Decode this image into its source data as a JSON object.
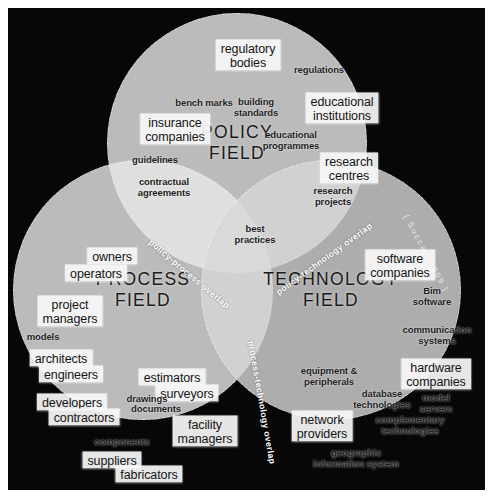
{
  "figure": {
    "citation": "( Succar, 2009 )",
    "background_color": "#070707",
    "frame_color": "#ffffff"
  },
  "fields": [
    {
      "id": "policy",
      "title": "POLICY\nFIELD",
      "color": "#e8e8e8",
      "center": {
        "x": 229,
        "y": 135
      }
    },
    {
      "id": "process",
      "title": "PROCESS\nFIELD",
      "color": "#e8e8e8",
      "center": {
        "x": 135,
        "y": 282
      }
    },
    {
      "id": "technology",
      "title": "TECHNOLOGY\nFIELD",
      "color": "#d7d7d7",
      "center": {
        "x": 323,
        "y": 282
      }
    }
  ],
  "overlaps": [
    {
      "id": "policy-process",
      "label": "policy-process overlap",
      "color": "#9a9a9a"
    },
    {
      "id": "policy-technology",
      "label": "policy-technology overlap",
      "color": "#9a9a9a"
    },
    {
      "id": "process-technology",
      "label": "process-technology overlap",
      "color": "#8e8e8e"
    }
  ],
  "keywords": {
    "policy": [
      {
        "text": "regulatory\nbodies",
        "style": "boxed",
        "x": 240,
        "y": 47
      },
      {
        "text": "regulations",
        "style": "plain",
        "x": 311,
        "y": 62
      },
      {
        "text": "bench marks",
        "style": "plain",
        "x": 196,
        "y": 95
      },
      {
        "text": "building\nstandards",
        "style": "plain",
        "x": 248,
        "y": 100
      },
      {
        "text": "educational\ninstitutions",
        "style": "boxed",
        "x": 334,
        "y": 100
      },
      {
        "text": "insurance\ncompanies",
        "style": "boxed",
        "x": 167,
        "y": 121
      },
      {
        "text": "educational\nprogrammes",
        "style": "plain",
        "x": 283,
        "y": 133
      },
      {
        "text": "guidelines",
        "style": "plain",
        "x": 147,
        "y": 152
      },
      {
        "text": "research\ncentres",
        "style": "boxed",
        "x": 341,
        "y": 160
      },
      {
        "text": "contractual\nagreements",
        "style": "plain",
        "x": 156,
        "y": 180
      },
      {
        "text": "research\nprojects",
        "style": "plain",
        "x": 325,
        "y": 189
      },
      {
        "text": "best\npractices",
        "style": "plain",
        "x": 247,
        "y": 227
      }
    ],
    "process": [
      {
        "text": "owners",
        "style": "boxed",
        "x": 104,
        "y": 248
      },
      {
        "text": "operators",
        "style": "boxed",
        "x": 88,
        "y": 265
      },
      {
        "text": "project\nmanagers",
        "style": "boxed",
        "x": 62,
        "y": 303
      },
      {
        "text": "models",
        "style": "plain",
        "x": 35,
        "y": 329
      },
      {
        "text": "architects",
        "style": "boxed",
        "x": 53,
        "y": 350
      },
      {
        "text": "engineers",
        "style": "boxed",
        "x": 63,
        "y": 366
      },
      {
        "text": "estimators",
        "style": "boxed",
        "x": 164,
        "y": 369
      },
      {
        "text": "surveyors",
        "style": "boxed",
        "x": 179,
        "y": 385
      },
      {
        "text": "developers",
        "style": "boxed",
        "x": 64,
        "y": 394
      },
      {
        "text": "drawings",
        "style": "plain",
        "x": 139,
        "y": 391
      },
      {
        "text": "documents",
        "style": "plain",
        "x": 148,
        "y": 401
      },
      {
        "text": "contractors",
        "style": "boxed",
        "x": 76,
        "y": 409
      },
      {
        "text": "facility\nmanagers",
        "style": "boxed",
        "x": 197,
        "y": 423
      },
      {
        "text": "components",
        "style": "plain",
        "x": 114,
        "y": 434
      },
      {
        "text": "suppliers",
        "style": "boxed",
        "x": 104,
        "y": 452
      },
      {
        "text": "fabricators",
        "style": "boxed",
        "x": 141,
        "y": 466
      }
    ],
    "technology": [
      {
        "text": "software\ncompanies",
        "style": "boxed",
        "x": 392,
        "y": 257
      },
      {
        "text": "Bim\nsoftware",
        "style": "plain",
        "x": 424,
        "y": 289
      },
      {
        "text": "communication\nsystems",
        "style": "plain",
        "x": 429,
        "y": 328
      },
      {
        "text": "equipment &\nperipherals",
        "style": "plain",
        "x": 321,
        "y": 369
      },
      {
        "text": "hardware\ncompanies",
        "style": "boxed",
        "x": 428,
        "y": 366
      },
      {
        "text": "database\ntechnologies",
        "style": "plain",
        "x": 374,
        "y": 392
      },
      {
        "text": "model\nservers",
        "style": "plain",
        "x": 428,
        "y": 396
      },
      {
        "text": "network\nproviders",
        "style": "boxed",
        "x": 314,
        "y": 418
      },
      {
        "text": "complementary\ntechnologies",
        "style": "plain",
        "x": 402,
        "y": 418
      },
      {
        "text": "geographic\ninformation system",
        "style": "plain",
        "x": 348,
        "y": 451
      }
    ]
  }
}
